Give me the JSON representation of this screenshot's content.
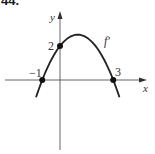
{
  "problem": {
    "number": "44."
  },
  "chart_data": {
    "type": "line",
    "title": "",
    "xlabel": "x",
    "ylabel": "y",
    "series": [
      {
        "name": "f′",
        "function": "f'(x) = -(2/3)(x+1)(x-3)",
        "x": [
          -1.3,
          -1,
          0,
          1,
          2,
          3,
          3.3
        ],
        "values": [
          -0.66,
          0,
          2,
          2.67,
          2,
          0,
          -0.66
        ]
      }
    ],
    "points": [
      {
        "x": -1,
        "y": 0,
        "label": "−1"
      },
      {
        "x": 0,
        "y": 2,
        "label": "2"
      },
      {
        "x": 3,
        "y": 0,
        "label": "3"
      }
    ],
    "curve_label": "f′",
    "grid": false,
    "color": "#222222"
  },
  "labels": {
    "x_axis": "x",
    "y_axis": "y",
    "curve": "f′",
    "pt_neg1": "−1",
    "pt_2": "2",
    "pt_3": "3"
  }
}
